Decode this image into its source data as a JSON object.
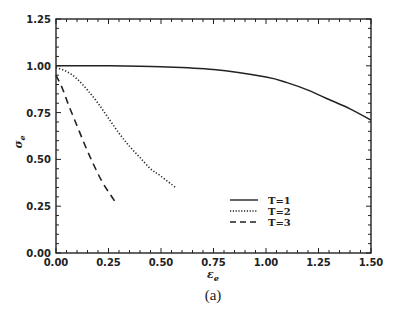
{
  "chart_data": {
    "type": "line",
    "title": "",
    "caption": "(a)",
    "xlabel": "ε",
    "xlabel_sub": "e",
    "ylabel": "σ",
    "ylabel_sub": "e",
    "xlim": [
      0,
      1.5
    ],
    "ylim": [
      0,
      1.25
    ],
    "xticks": [
      "0.00",
      "0.25",
      "0.50",
      "0.75",
      "1.00",
      "1.25",
      "1.50"
    ],
    "yticks": [
      "0.00",
      "0.25",
      "0.50",
      "0.75",
      "1.00",
      "1.25"
    ],
    "grid": false,
    "legend_position": "lower center-right, inside plot",
    "series": [
      {
        "name": "T=1",
        "style": "solid",
        "x": [
          0,
          0.25,
          0.5,
          0.75,
          1.0,
          1.1,
          1.2,
          1.3,
          1.4,
          1.5
        ],
        "y": [
          1.0,
          1.0,
          0.995,
          0.98,
          0.94,
          0.91,
          0.87,
          0.82,
          0.77,
          0.71
        ]
      },
      {
        "name": "T=2",
        "style": "dotted",
        "x": [
          0,
          0.05,
          0.1,
          0.15,
          0.2,
          0.25,
          0.3,
          0.35,
          0.4,
          0.45,
          0.5,
          0.57
        ],
        "y": [
          0.99,
          0.97,
          0.93,
          0.87,
          0.8,
          0.72,
          0.64,
          0.57,
          0.51,
          0.45,
          0.41,
          0.35
        ]
      },
      {
        "name": "T=3",
        "style": "dashed",
        "x": [
          0,
          0.03,
          0.06,
          0.1,
          0.14,
          0.18,
          0.22,
          0.26,
          0.29
        ],
        "y": [
          0.95,
          0.88,
          0.79,
          0.68,
          0.57,
          0.47,
          0.38,
          0.31,
          0.26
        ]
      }
    ]
  }
}
